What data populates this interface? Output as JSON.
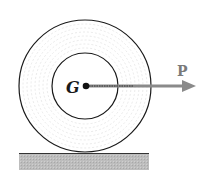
{
  "diagram": {
    "type": "wheel-on-ground",
    "labels": {
      "center": "G",
      "force": "P"
    },
    "colors": {
      "outline": "#1a1a1a",
      "hatch": "#d0d0d0",
      "arrow": "#8a8a8a",
      "ground": "#b8b8b8",
      "ground_edge": "#333333"
    }
  }
}
